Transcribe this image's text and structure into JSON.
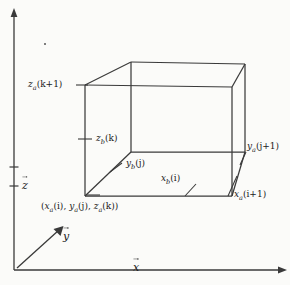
{
  "figure": {
    "background_color": "#fbfbf9",
    "line_color": "#3a3a3a",
    "text_color": "#1a1a1a",
    "axes": {
      "x_label": "x",
      "y_label": "y",
      "z_label": "z",
      "vector_notation": "arrow-over"
    },
    "labels": {
      "z_a_k1": {
        "base": "z",
        "sub": "a",
        "arg": "(k+1)"
      },
      "z_b_k": {
        "base": "z",
        "sub": "b",
        "arg": "(k)"
      },
      "y_b_j": {
        "base": "y",
        "sub": "b",
        "arg": "(j)"
      },
      "x_b_i": {
        "base": "x",
        "sub": "b",
        "arg": "(i)"
      },
      "y_a_j1": {
        "base": "y",
        "sub": "a",
        "arg": "(j+1)"
      },
      "x_a_i1": {
        "base": "x",
        "sub": "a",
        "arg": "(i+1)"
      },
      "origin_tuple": {
        "open": "(",
        "p1": {
          "base": "x",
          "sub": "a",
          "arg": "(i)"
        },
        "sep1": ", ",
        "p2": {
          "base": "y",
          "sub": "a",
          "arg": "(j)"
        },
        "sep2": ", ",
        "p3": {
          "base": "z",
          "sub": "a",
          "arg": "(k)"
        },
        "close": ")"
      }
    },
    "geometry": {
      "front_bottom_left": [
        85,
        196
      ],
      "front_bottom_right": [
        232,
        196
      ],
      "front_top_left": [
        85,
        85
      ],
      "front_top_right": [
        232,
        87
      ],
      "back_bottom_left": [
        131,
        152
      ],
      "back_bottom_right": [
        245,
        152
      ],
      "back_top_left": [
        131,
        62
      ],
      "back_top_right": [
        245,
        64
      ],
      "axis_origin": [
        14,
        270
      ],
      "x_axis_end": [
        285,
        270
      ],
      "z_axis_end": [
        14,
        10
      ],
      "y_axis_end": [
        62,
        228
      ]
    }
  }
}
